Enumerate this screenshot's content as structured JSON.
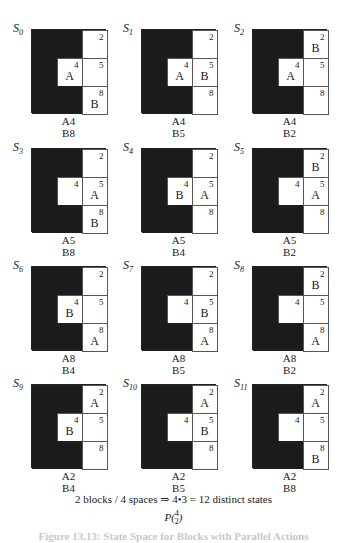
{
  "cells": [
    "2",
    "4",
    "5",
    "8"
  ],
  "states": [
    {
      "label": "S",
      "sub": "0",
      "A": "4",
      "B": "8",
      "posA": "A4",
      "posB": "B8"
    },
    {
      "label": "S",
      "sub": "1",
      "A": "4",
      "B": "5",
      "posA": "A4",
      "posB": "B5"
    },
    {
      "label": "S",
      "sub": "2",
      "A": "4",
      "B": "2",
      "posA": "A4",
      "posB": "B2"
    },
    {
      "label": "S",
      "sub": "3",
      "A": "5",
      "B": "8",
      "posA": "A5",
      "posB": "B8"
    },
    {
      "label": "S",
      "sub": "4",
      "A": "5",
      "B": "4",
      "posA": "A5",
      "posB": "B4"
    },
    {
      "label": "S",
      "sub": "5",
      "A": "5",
      "B": "2",
      "posA": "A5",
      "posB": "B2"
    },
    {
      "label": "S",
      "sub": "6",
      "A": "8",
      "B": "4",
      "posA": "A8",
      "posB": "B4"
    },
    {
      "label": "S",
      "sub": "7",
      "A": "8",
      "B": "5",
      "posA": "A8",
      "posB": "B5"
    },
    {
      "label": "S",
      "sub": "8",
      "A": "8",
      "B": "2",
      "posA": "A8",
      "posB": "B2"
    },
    {
      "label": "S",
      "sub": "9",
      "A": "2",
      "B": "4",
      "posA": "A2",
      "posB": "B4"
    },
    {
      "label": "S",
      "sub": "10",
      "A": "2",
      "B": "5",
      "posA": "A2",
      "posB": "B5"
    },
    {
      "label": "S",
      "sub": "11",
      "A": "2",
      "B": "8",
      "posA": "A2",
      "posB": "B8"
    }
  ],
  "summary": "2 blocks / 4 spaces ⇒ 4•3 = 12 distinct states",
  "perm": {
    "P": "P(",
    "n": "4",
    "k": "2",
    "close": ")"
  },
  "caption": "Figure 13.13: State Space for Blocks with Parallel Actions",
  "colors": {
    "wall": "#1c1c1c",
    "open": "#ffffff"
  }
}
